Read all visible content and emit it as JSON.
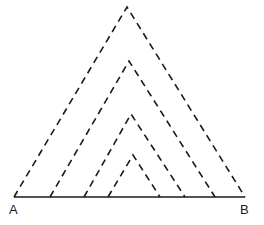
{
  "diagram": {
    "labels": {
      "left": "A",
      "right": "B"
    },
    "stroke_color": "#1a1a1a",
    "base": {
      "y": 197,
      "x1": 14,
      "x2": 245
    },
    "triangles": [
      {
        "apex": [
          127,
          7
        ],
        "left": [
          14,
          197
        ],
        "right": [
          245,
          197
        ]
      },
      {
        "apex": [
          129,
          61
        ],
        "left": [
          50,
          197
        ],
        "right": [
          215,
          197
        ]
      },
      {
        "apex": [
          131,
          114
        ],
        "left": [
          84,
          197
        ],
        "right": [
          185,
          197
        ]
      },
      {
        "apex": [
          133,
          155
        ],
        "left": [
          108,
          197
        ],
        "right": [
          160,
          197
        ]
      }
    ]
  }
}
